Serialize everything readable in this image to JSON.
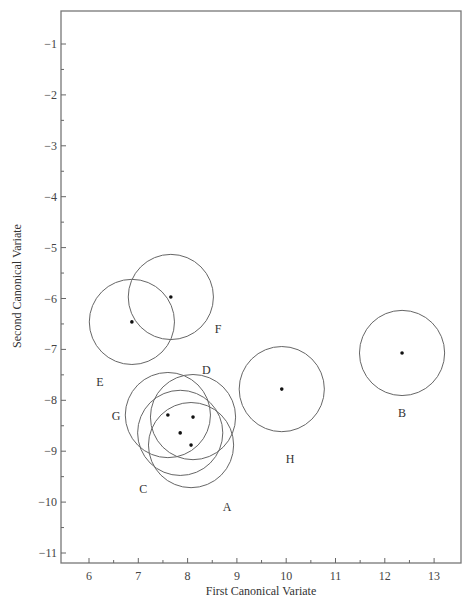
{
  "chart_data": {
    "type": "scatter",
    "title": "",
    "xlabel": "First Canonical Variate",
    "ylabel": "Second Canonical Variate",
    "xlim": [
      5.43,
      13.55
    ],
    "ylim": [
      -11.2,
      -0.35
    ],
    "grid": false,
    "legend": null,
    "x_ticks": [
      6,
      7,
      8,
      9,
      10,
      11,
      12,
      13
    ],
    "y_ticks": [
      -1,
      -2,
      -3,
      -4,
      -5,
      -6,
      -7,
      -8,
      -9,
      -10,
      -11
    ],
    "x_minor_ticks": [
      6.5,
      7.5,
      8.5,
      9.5,
      10.5,
      11.5,
      12.5
    ],
    "y_minor_ticks": [
      -1.5,
      -2.5,
      -3.5,
      -4.5,
      -5.5,
      -6.5,
      -7.5,
      -8.5,
      -9.5,
      -10.5
    ],
    "circle_radius": 0.85,
    "points": [
      {
        "label": "A",
        "x": 8.07,
        "y": -8.88,
        "label_x": 8.8,
        "label_y": -10.1
      },
      {
        "label": "B",
        "x": 12.35,
        "y": -7.07,
        "label_x": 12.35,
        "label_y": -8.25
      },
      {
        "label": "C",
        "x": 7.85,
        "y": -8.64,
        "label_x": 7.1,
        "label_y": -9.75
      },
      {
        "label": "D",
        "x": 8.11,
        "y": -8.33,
        "label_x": 8.38,
        "label_y": -7.4
      },
      {
        "label": "E",
        "x": 6.87,
        "y": -6.46,
        "label_x": 6.22,
        "label_y": -7.65
      },
      {
        "label": "F",
        "x": 7.66,
        "y": -5.97,
        "label_x": 8.62,
        "label_y": -6.6
      },
      {
        "label": "G",
        "x": 7.6,
        "y": -8.29,
        "label_x": 6.55,
        "label_y": -8.3
      },
      {
        "label": "H",
        "x": 9.91,
        "y": -7.78,
        "label_x": 10.08,
        "label_y": -9.15
      }
    ],
    "annotations": "Each group mean is plotted as a dot surrounded by a circle (confidence region)."
  }
}
